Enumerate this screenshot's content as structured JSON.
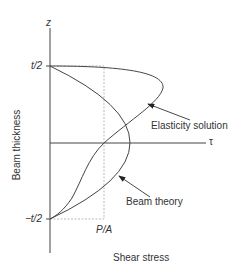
{
  "diagram": {
    "axes": {
      "vertical_label": "z",
      "horizontal_label": "τ",
      "y_axis_title": "Beam thickness",
      "x_axis_title": "Shear stress"
    },
    "ticks": {
      "top": "t/2",
      "bottom": "−t/2",
      "reference": "P/A"
    },
    "curves": [
      {
        "name": "Elasticity solution",
        "label": "Elasticity solution"
      },
      {
        "name": "Beam theory",
        "label": "Beam theory"
      }
    ],
    "colors": {
      "line": "#444444",
      "guide": "#aaaaaa",
      "text": "#333333"
    }
  }
}
